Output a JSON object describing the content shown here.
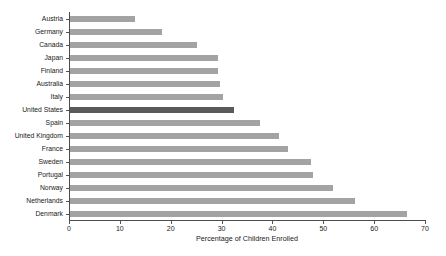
{
  "chart_data": {
    "type": "bar",
    "orientation": "horizontal",
    "title": "",
    "xlabel": "Percentage of Children Enrolled",
    "ylabel": "",
    "xlim": [
      0,
      70
    ],
    "xticks": [
      0,
      10,
      20,
      30,
      40,
      50,
      60,
      70
    ],
    "grid": false,
    "legend": "none",
    "categories": [
      "Austria",
      "Germany",
      "Canada",
      "Japan",
      "Finland",
      "Australia",
      "Italy",
      "United States",
      "Spain",
      "United Kingdom",
      "France",
      "Sweden",
      "Portugal",
      "Norway",
      "Netherlands",
      "Denmark"
    ],
    "values": [
      12.8,
      18.1,
      25.0,
      29.1,
      29.1,
      29.5,
      30.0,
      32.2,
      37.4,
      41.1,
      42.9,
      47.4,
      47.7,
      51.7,
      56.0,
      66.3
    ],
    "highlight_category": "United States",
    "colors": {
      "bar": "#a3a3a3",
      "highlight_bar": "#5a5a5a",
      "axis": "#4d4d4d",
      "text": "#1a1a1a",
      "background": "#ffffff"
    }
  }
}
